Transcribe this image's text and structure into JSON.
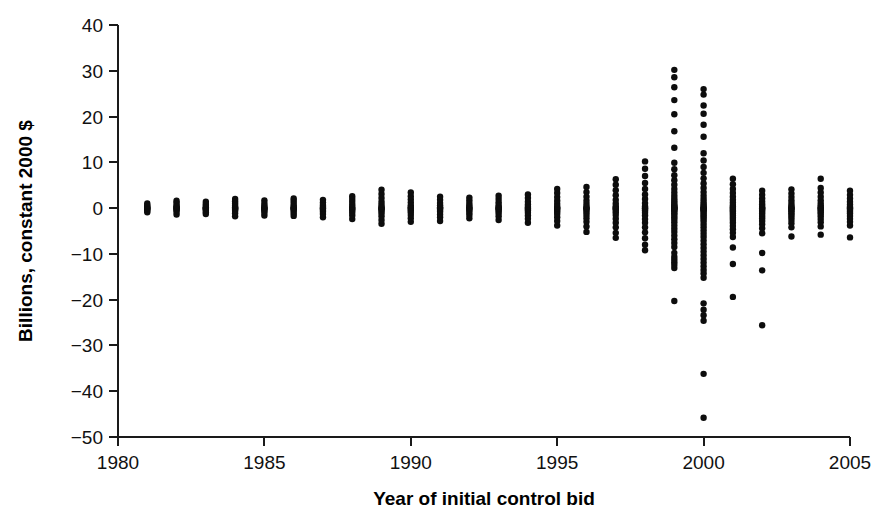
{
  "chart_data": {
    "type": "scatter",
    "title": "",
    "xlabel": "Year of initial control bid",
    "ylabel": "Billions, constant 2000 $",
    "xlim": [
      1980,
      2005
    ],
    "ylim": [
      -50,
      40
    ],
    "xticks": [
      1980,
      1985,
      1990,
      1995,
      2000,
      2005
    ],
    "yticks": [
      40,
      30,
      20,
      10,
      0,
      -10,
      -20,
      -30,
      -40,
      -50
    ],
    "xtick_labels": [
      "1980",
      "1985",
      "1990",
      "1995",
      "2000",
      "2005"
    ],
    "ytick_labels": [
      "40",
      "30",
      "20",
      "10",
      "0",
      "-10",
      "-20",
      "-30",
      "-40",
      "-50"
    ],
    "grid": false,
    "legend": null,
    "marker": "filled-circle",
    "marker_color": "#0d0d0d",
    "marker_size": 3.2,
    "series": [
      {
        "name": "Acquirer dollar return at initial control bid",
        "points_by_year": [
          {
            "x": 1981,
            "y": [
              -0.9,
              -0.5,
              -0.3,
              -0.1,
              0.0,
              0.1,
              0.3,
              0.6,
              1.0
            ]
          },
          {
            "x": 1982,
            "y": [
              -1.4,
              -0.8,
              -0.4,
              -0.2,
              0.0,
              0.1,
              0.4,
              0.7,
              1.2,
              1.6
            ]
          },
          {
            "x": 1983,
            "y": [
              -1.3,
              -0.9,
              -0.5,
              -0.2,
              -0.1,
              0.0,
              0.2,
              0.5,
              0.9,
              1.4
            ]
          },
          {
            "x": 1984,
            "y": [
              -1.8,
              -1.1,
              -0.6,
              -0.3,
              -0.1,
              0.0,
              0.2,
              0.5,
              1.0,
              1.5,
              2.0
            ]
          },
          {
            "x": 1985,
            "y": [
              -1.6,
              -1.0,
              -0.6,
              -0.3,
              -0.1,
              0.0,
              0.2,
              0.6,
              1.1,
              1.7
            ]
          },
          {
            "x": 1986,
            "y": [
              -1.7,
              -1.2,
              -0.7,
              -0.3,
              -0.1,
              0.0,
              0.2,
              0.6,
              1.1,
              1.6,
              2.1
            ]
          },
          {
            "x": 1987,
            "y": [
              -2.0,
              -1.3,
              -0.8,
              -0.4,
              -0.1,
              0.0,
              0.3,
              0.7,
              1.2,
              1.8
            ]
          },
          {
            "x": 1988,
            "y": [
              -2.4,
              -1.6,
              -1.0,
              -0.5,
              -0.2,
              0.0,
              0.3,
              0.8,
              1.4,
              2.0,
              2.6
            ]
          },
          {
            "x": 1989,
            "y": [
              -3.4,
              -2.6,
              -1.8,
              -1.2,
              -0.7,
              -0.3,
              -0.1,
              0.0,
              0.3,
              0.8,
              1.4,
              2.2,
              3.1,
              4.0
            ]
          },
          {
            "x": 1990,
            "y": [
              -3.0,
              -2.2,
              -1.5,
              -0.9,
              -0.5,
              -0.2,
              0.0,
              0.2,
              0.6,
              1.2,
              1.9,
              2.6,
              3.4
            ]
          },
          {
            "x": 1991,
            "y": [
              -2.8,
              -2.0,
              -1.4,
              -0.8,
              -0.4,
              -0.1,
              0.0,
              0.2,
              0.6,
              1.1,
              1.8,
              2.5
            ]
          },
          {
            "x": 1992,
            "y": [
              -2.2,
              -1.5,
              -1.0,
              -0.5,
              -0.2,
              0.0,
              0.2,
              0.6,
              1.1,
              1.7,
              2.3
            ]
          },
          {
            "x": 1993,
            "y": [
              -2.6,
              -1.8,
              -1.2,
              -0.7,
              -0.3,
              -0.1,
              0.0,
              0.3,
              0.7,
              1.3,
              2.0,
              2.7
            ]
          },
          {
            "x": 1994,
            "y": [
              -3.2,
              -2.3,
              -1.6,
              -1.0,
              -0.5,
              -0.2,
              0.0,
              0.3,
              0.8,
              1.4,
              2.2,
              3.0
            ]
          },
          {
            "x": 1995,
            "y": [
              -3.8,
              -2.8,
              -2.0,
              -1.3,
              -0.8,
              -0.4,
              -0.1,
              0.0,
              0.3,
              0.9,
              1.6,
              2.4,
              3.3,
              4.2
            ]
          },
          {
            "x": 1996,
            "y": [
              -5.2,
              -4.0,
              -3.0,
              -2.2,
              -1.5,
              -0.9,
              -0.4,
              -0.1,
              0.0,
              0.3,
              0.9,
              1.6,
              2.5,
              3.5,
              4.6
            ]
          },
          {
            "x": 1997,
            "y": [
              -6.5,
              -5.4,
              -4.2,
              -3.2,
              -2.3,
              -1.5,
              -0.9,
              -0.4,
              -0.1,
              0.0,
              0.4,
              1.0,
              1.8,
              2.8,
              3.9,
              5.1,
              6.3
            ]
          },
          {
            "x": 1998,
            "y": [
              -9.2,
              -8.0,
              -6.6,
              -5.3,
              -4.2,
              -3.2,
              -2.4,
              -1.6,
              -1.0,
              -0.5,
              -0.1,
              0.0,
              0.4,
              1.1,
              2.0,
              3.0,
              4.2,
              5.5,
              7.0,
              8.6,
              10.2
            ]
          },
          {
            "x": 1999,
            "y": [
              -20.3,
              -13.1,
              -12.4,
              -11.8,
              -11.2,
              -10.6,
              -9.8,
              -8.5,
              -7.6,
              -6.8,
              -6.0,
              -5.2,
              -4.5,
              -3.8,
              -3.1,
              -2.5,
              -2.0,
              -1.5,
              -1.1,
              -0.7,
              -0.4,
              -0.2,
              -0.1,
              0.0,
              0.1,
              0.3,
              0.5,
              0.8,
              1.2,
              1.6,
              2.1,
              2.7,
              3.4,
              4.2,
              5.1,
              6.1,
              7.2,
              8.5,
              9.9,
              13.2,
              16.8,
              20.5,
              23.6,
              26.4,
              28.6,
              30.2
            ]
          },
          {
            "x": 2000,
            "y": [
              -45.8,
              -36.2,
              -24.6,
              -23.4,
              -22.2,
              -20.8,
              -15.2,
              -14.3,
              -13.5,
              -12.7,
              -11.9,
              -11.1,
              -10.3,
              -9.5,
              -8.7,
              -7.9,
              -7.1,
              -6.3,
              -5.6,
              -4.9,
              -4.2,
              -3.6,
              -3.0,
              -2.5,
              -2.0,
              -1.6,
              -1.2,
              -0.8,
              -0.5,
              -0.3,
              -0.1,
              0.0,
              0.2,
              0.5,
              0.9,
              1.4,
              2.0,
              2.7,
              3.5,
              4.4,
              5.4,
              6.5,
              7.7,
              9.0,
              10.4,
              12.0,
              15.6,
              18.2,
              20.6,
              22.4,
              24.8,
              26.0
            ]
          },
          {
            "x": 2001,
            "y": [
              -19.4,
              -12.2,
              -8.6,
              -6.3,
              -5.4,
              -4.6,
              -3.9,
              -3.2,
              -2.6,
              -2.1,
              -1.6,
              -1.2,
              -0.8,
              -0.5,
              -0.2,
              0.0,
              0.3,
              0.7,
              1.2,
              1.8,
              2.5,
              3.3,
              4.2,
              5.2,
              6.4
            ]
          },
          {
            "x": 2002,
            "y": [
              -25.6,
              -13.6,
              -9.8,
              -5.5,
              -4.4,
              -3.5,
              -2.8,
              -2.2,
              -1.7,
              -1.2,
              -0.8,
              -0.4,
              -0.1,
              0.0,
              0.3,
              0.8,
              1.4,
              2.1,
              2.9,
              3.8
            ]
          },
          {
            "x": 2003,
            "y": [
              -6.2,
              -4.2,
              -3.3,
              -2.6,
              -2.0,
              -1.5,
              -1.1,
              -0.7,
              -0.4,
              -0.1,
              0.0,
              0.2,
              0.6,
              1.1,
              1.7,
              2.4,
              3.2,
              4.1
            ]
          },
          {
            "x": 2004,
            "y": [
              -5.8,
              -4.0,
              -3.1,
              -2.4,
              -1.8,
              -1.3,
              -0.9,
              -0.5,
              -0.2,
              0.0,
              0.2,
              0.6,
              1.1,
              1.7,
              2.5,
              3.4,
              4.4,
              6.4
            ]
          },
          {
            "x": 2005,
            "y": [
              -6.4,
              -3.8,
              -3.0,
              -2.3,
              -1.7,
              -1.2,
              -0.8,
              -0.4,
              -0.1,
              0.0,
              0.3,
              0.8,
              1.4,
              2.1,
              2.9,
              3.8
            ]
          }
        ]
      }
    ]
  }
}
